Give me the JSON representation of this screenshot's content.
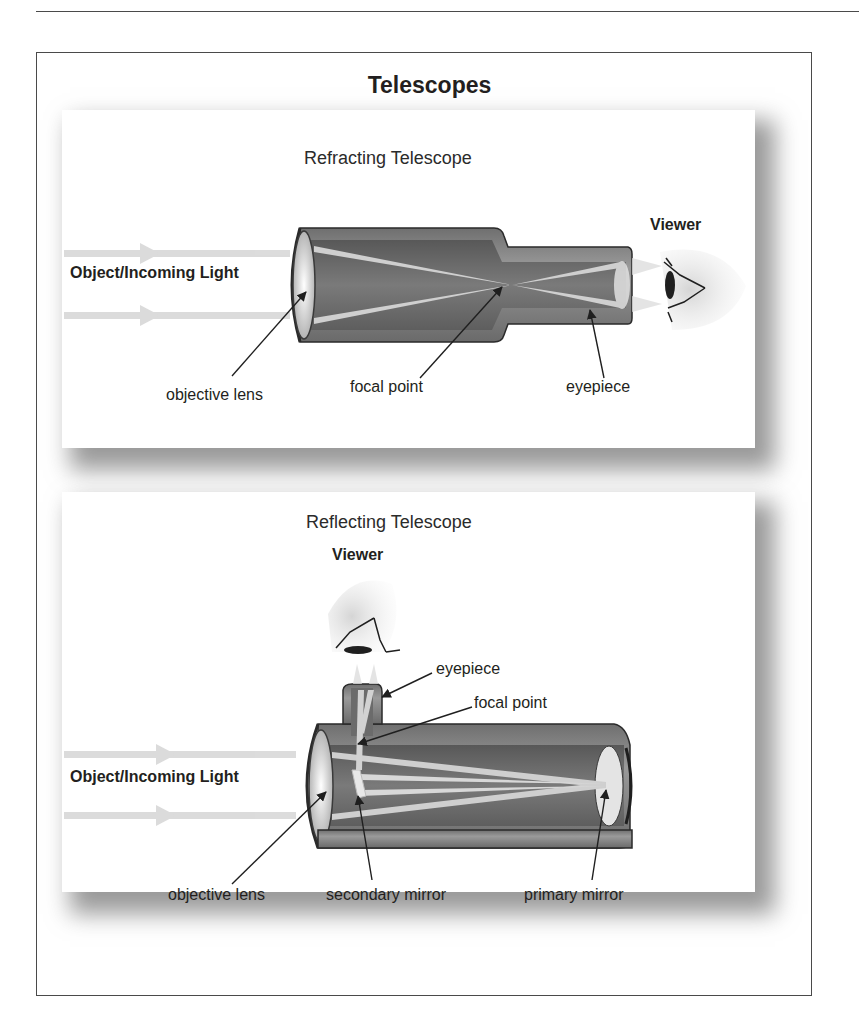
{
  "title": "Telescopes",
  "refracting": {
    "subtitle": "Refracting Telescope",
    "viewer_label": "Viewer",
    "incoming_label": "Object/Incoming Light",
    "labels": {
      "objective_lens": "objective lens",
      "focal_point": "focal point",
      "eyepiece": "eyepiece"
    }
  },
  "reflecting": {
    "subtitle": "Reflecting Telescope",
    "viewer_label": "Viewer",
    "incoming_label": "Object/Incoming Light",
    "labels": {
      "eyepiece": "eyepiece",
      "focal_point": "focal point",
      "objective_lens": "objective lens",
      "secondary_mirror": "secondary mirror",
      "primary_mirror": "primary mirror"
    }
  },
  "colors": {
    "tube_dark": "#5c5c5c",
    "tube_mid": "#8a8a8a",
    "tube_light": "#b5b5b5",
    "light_ray": "#d6d6d6",
    "outline": "#2a2a2a"
  }
}
